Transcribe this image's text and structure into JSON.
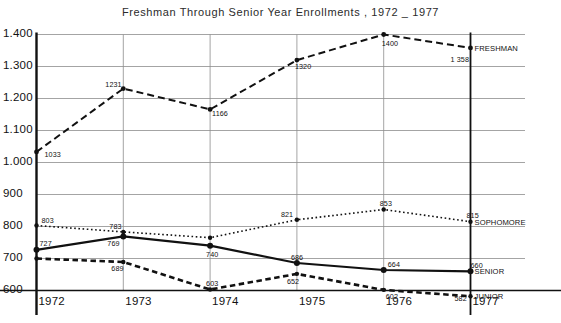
{
  "chart_data": {
    "type": "line",
    "title": "Freshman Through Senior Year Enrollments , 1972 _ 1977",
    "xlabel": "",
    "ylabel": "",
    "categories": [
      "1972",
      "1973",
      "1974",
      "1975",
      "1976",
      "1977"
    ],
    "x": [
      1972,
      1973,
      1974,
      1975,
      1976,
      1977
    ],
    "ylim": [
      600,
      1400
    ],
    "xlim": [
      1972,
      1977
    ],
    "ytick_labels": [
      "1.400",
      "1.300",
      "1.200",
      "1.100",
      "1.000",
      "900",
      "800",
      "700",
      "600"
    ],
    "ytick_values": [
      1400,
      1300,
      1200,
      1100,
      1000,
      900,
      800,
      700,
      600
    ],
    "xtick_labels": [
      "1972",
      "1973",
      "1974",
      "1975",
      "1976",
      "1977"
    ],
    "grid": true,
    "legend_position": "right-inline",
    "series": [
      {
        "name": "FRESHMAN",
        "style": "dashed",
        "values": [
          1033,
          1231,
          1166,
          1320,
          1400,
          1358
        ],
        "point_labels": [
          "1033",
          "1231",
          "1166",
          "1320",
          "1400",
          "1 358"
        ]
      },
      {
        "name": "SOPHOMORE",
        "style": "dotted",
        "values": [
          803,
          783,
          765,
          821,
          853,
          815
        ],
        "point_labels": [
          "803",
          "783",
          "",
          "821",
          "853",
          "815"
        ]
      },
      {
        "name": "SENIOR",
        "style": "solid",
        "values": [
          727,
          769,
          740,
          686,
          664,
          660
        ],
        "point_labels": [
          "727",
          "769",
          "740",
          "686",
          "664",
          "660"
        ]
      },
      {
        "name": "JUNIOR",
        "style": "dashed-bold",
        "values": [
          700,
          689,
          603,
          652,
          602,
          582
        ],
        "point_labels": [
          "",
          "689",
          "603",
          "652",
          "602",
          "582"
        ]
      }
    ]
  }
}
